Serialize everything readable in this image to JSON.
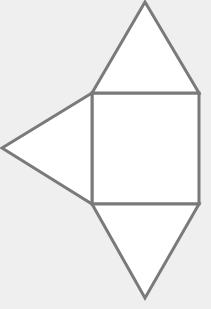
{
  "diagram": {
    "background_color": "#efefef",
    "stroke_color": "#7a7a7a",
    "fill_color": "#ffffff",
    "stroke_width": 3,
    "shapes": [
      {
        "name": "square-face",
        "type": "polygon",
        "points": "92,93 199,93 199,204 92,204"
      },
      {
        "name": "top-triangle-face",
        "type": "polygon",
        "points": "92,93 145,2 199,93"
      },
      {
        "name": "left-triangle-face",
        "type": "polygon",
        "points": "92,93 2,148 92,204"
      },
      {
        "name": "bottom-triangle-face",
        "type": "polygon",
        "points": "92,204 145,298 199,204"
      }
    ]
  }
}
